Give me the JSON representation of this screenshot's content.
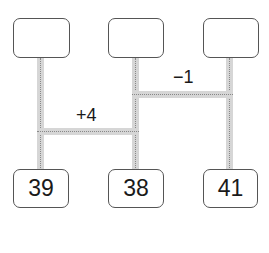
{
  "top_boxes": [
    "",
    "",
    ""
  ],
  "bottom_boxes": [
    "39",
    "38",
    "41"
  ],
  "connectors": [
    {
      "label": "+4",
      "from": 0,
      "to": 1
    },
    {
      "label": "−1",
      "from": 1,
      "to": 2
    }
  ]
}
